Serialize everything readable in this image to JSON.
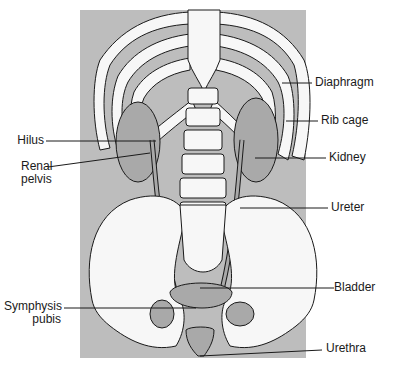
{
  "diagram": {
    "colors": {
      "background": "#ffffff",
      "body_silhouette": "#bdbdbd",
      "bone": "#f7f7f7",
      "organ": "#a9a9a9",
      "outline": "#1a1a1a"
    },
    "labels": {
      "left": [
        {
          "id": "hilus",
          "text": "Hilus"
        },
        {
          "id": "renal-pelvis",
          "line1": "Renal",
          "line2": "pelvis"
        },
        {
          "id": "symphysis-pubis",
          "line1": "Symphysis",
          "line2": "pubis"
        }
      ],
      "right": [
        {
          "id": "diaphragm",
          "text": "Diaphragm"
        },
        {
          "id": "rib-cage",
          "text": "Rib cage"
        },
        {
          "id": "kidney",
          "text": "Kidney"
        },
        {
          "id": "ureter",
          "text": "Ureter"
        },
        {
          "id": "bladder",
          "text": "Bladder"
        },
        {
          "id": "urethra",
          "text": "Urethra"
        }
      ]
    }
  }
}
